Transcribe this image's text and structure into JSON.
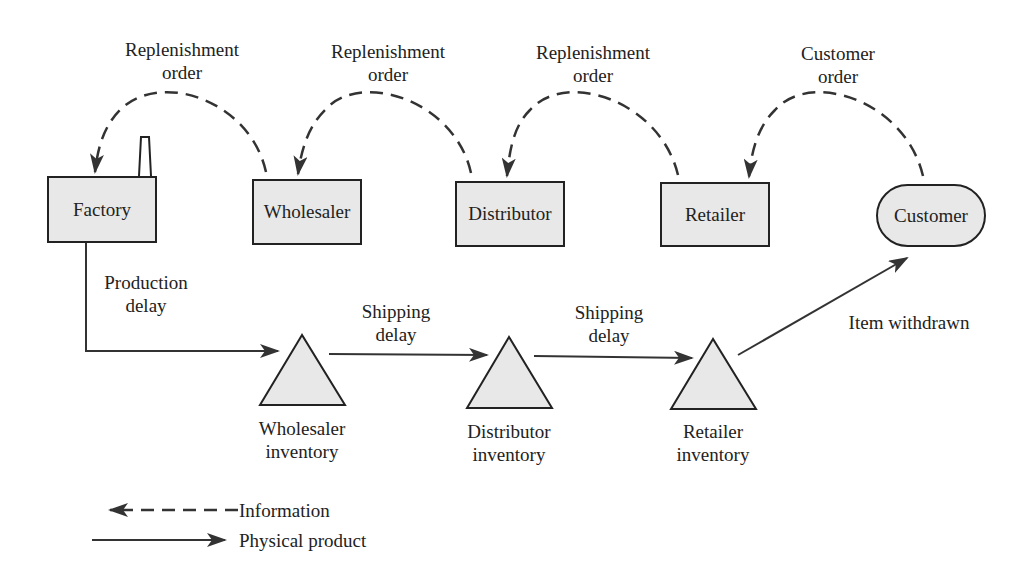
{
  "nodes": {
    "factory": "Factory",
    "wholesaler": "Wholesaler",
    "distributor": "Distributor",
    "retailer": "Retailer",
    "customer": "Customer"
  },
  "info_flows": [
    {
      "line1": "Replenishment",
      "line2": "order",
      "from": "Wholesaler",
      "to": "Factory"
    },
    {
      "line1": "Replenishment",
      "line2": "order",
      "from": "Distributor",
      "to": "Wholesaler"
    },
    {
      "line1": "Replenishment",
      "line2": "order",
      "from": "Retailer",
      "to": "Distributor"
    },
    {
      "line1": "Customer",
      "line2": "order",
      "from": "Customer",
      "to": "Retailer"
    }
  ],
  "product_flows": [
    {
      "line1": "Production",
      "line2": "delay",
      "from": "Factory",
      "to": "Wholesaler inventory"
    },
    {
      "line1": "Shipping",
      "line2": "delay",
      "from": "Wholesaler inventory",
      "to": "Distributor inventory"
    },
    {
      "line1": "Shipping",
      "line2": "delay",
      "from": "Distributor inventory",
      "to": "Retailer inventory"
    },
    {
      "line1": "Item withdrawn",
      "from": "Retailer inventory",
      "to": "Customer"
    }
  ],
  "inventories": [
    {
      "line1": "Wholesaler",
      "line2": "inventory"
    },
    {
      "line1": "Distributor",
      "line2": "inventory"
    },
    {
      "line1": "Retailer",
      "line2": "inventory"
    }
  ],
  "legend": {
    "information": "Information",
    "physical": "Physical product"
  },
  "colors": {
    "fill": "#e8e8e8",
    "stroke": "#222222",
    "arrow": "#333333"
  }
}
